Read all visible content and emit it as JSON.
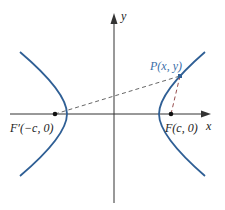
{
  "figure": {
    "type": "hyperbola-diagram",
    "axes": {
      "x_label": "x",
      "y_label": "y"
    },
    "foci": [
      {
        "name": "F'",
        "label": "F′(−c, 0)"
      },
      {
        "name": "F",
        "label": "F(c, 0)"
      }
    ],
    "point": {
      "name": "P",
      "label": "P(x, y)"
    },
    "colors": {
      "curve": "#2f5f95",
      "point_label": "#3b6fa8",
      "axes": "#333333",
      "dashed": "#555555",
      "focus_dot": "#111111"
    }
  }
}
